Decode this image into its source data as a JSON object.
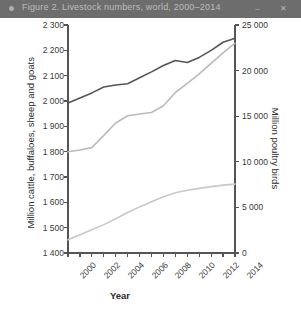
{
  "window": {
    "title": "Figure 2. Livestock numbers, world, 2000–2014",
    "dot_icon": "app-dot-icon",
    "minimize_label": "–",
    "close_label": "✕"
  },
  "chart_data": {
    "type": "line",
    "title": "",
    "xlabel": "Year",
    "ylabel": "Million cattle, buffaloes, sheep and goats",
    "y2label": "Million poultry birds",
    "x": [
      2000,
      2001,
      2002,
      2003,
      2004,
      2005,
      2006,
      2007,
      2008,
      2009,
      2010,
      2011,
      2012,
      2013,
      2014
    ],
    "xlim": [
      2000,
      2014
    ],
    "ylim": [
      1400,
      2300
    ],
    "y2lim": [
      0,
      25000
    ],
    "xticks": [
      2000,
      2001,
      2002,
      2003,
      2004,
      2005,
      2006,
      2007,
      2008,
      2009,
      2010,
      2011,
      2012,
      2013,
      2014
    ],
    "xticklabels": [
      "2000",
      "",
      "2002",
      "",
      "2004",
      "",
      "2006",
      "",
      "2008",
      "",
      "2010",
      "",
      "2012",
      "",
      "2014"
    ],
    "xticklabels_shown": [
      "2000",
      "2002",
      "2004",
      "2006",
      "2008",
      "2010",
      "2012",
      "2014"
    ],
    "yticks": [
      1400,
      1500,
      1600,
      1700,
      1800,
      1900,
      2000,
      2100,
      2200,
      2300
    ],
    "yticklabels": [
      "1 400",
      "1 500",
      "1 600",
      "1 700",
      "1 800",
      "1 900",
      "2 000",
      "2 100",
      "2 200",
      "2 300"
    ],
    "y2ticks": [
      0,
      5000,
      10000,
      15000,
      20000,
      25000
    ],
    "y2ticklabels": [
      "0",
      "5 000",
      "10 000",
      "15 000",
      "20 000",
      "25 000"
    ],
    "grid": false,
    "legend": "none",
    "series": [
      {
        "name": "Cattle, buffaloes, sheep and goats",
        "axis": "left",
        "color": "#555555",
        "width": 1.6,
        "values": [
          1992,
          2012,
          2032,
          2055,
          2063,
          2068,
          2092,
          2115,
          2140,
          2160,
          2152,
          2172,
          2200,
          2232,
          2248
        ]
      },
      {
        "name": "Poultry birds",
        "axis": "right",
        "color": "#bbbbbb",
        "width": 1.6,
        "values": [
          11100,
          11300,
          11550,
          12900,
          14250,
          15050,
          15250,
          15400,
          16150,
          17600,
          18600,
          19650,
          20800,
          21950,
          23000
        ]
      },
      {
        "name": "Cattle and buffaloes",
        "axis": "left",
        "color": "#c8c8c8",
        "width": 1.6,
        "values": [
          1452,
          1472,
          1492,
          1512,
          1535,
          1560,
          1582,
          1602,
          1622,
          1638,
          1648,
          1655,
          1662,
          1668,
          1672
        ]
      }
    ]
  }
}
